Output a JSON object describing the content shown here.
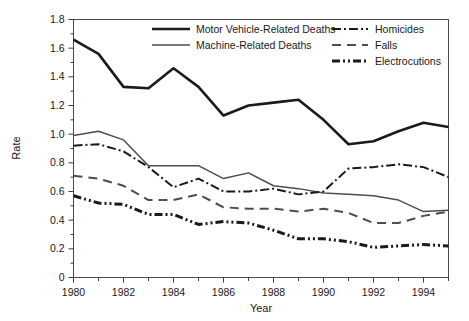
{
  "chart_data": {
    "type": "line",
    "title": "",
    "xlabel": "Year",
    "ylabel": "Rate",
    "xlim": [
      1980,
      1995
    ],
    "ylim": [
      0,
      1.8
    ],
    "grid": false,
    "legend_position": "top-inside",
    "x": [
      1980,
      1981,
      1982,
      1983,
      1984,
      1985,
      1986,
      1987,
      1988,
      1989,
      1990,
      1991,
      1992,
      1993,
      1994,
      1995
    ],
    "xtick_labels": [
      "1980",
      "1982",
      "1984",
      "1986",
      "1988",
      "1990",
      "1992",
      "1994"
    ],
    "xtick_values": [
      1980,
      1982,
      1984,
      1986,
      1988,
      1990,
      1992,
      1994
    ],
    "xminor_values": [
      1981,
      1983,
      1985,
      1987,
      1989,
      1991,
      1993,
      1995
    ],
    "ytick_labels": [
      "0",
      "0.2",
      "0.4",
      "0.6",
      "0.8",
      "1.0",
      "1.2",
      "1.4",
      "1.6",
      "1.8"
    ],
    "ytick_values": [
      0,
      0.2,
      0.4,
      0.6,
      0.8,
      1.0,
      1.2,
      1.4,
      1.6,
      1.8
    ],
    "series": [
      {
        "name": "Motor Vehicle-Related Deaths",
        "style": "solid-thick",
        "color": "#1a1a1a",
        "width": 2.6,
        "dash": "",
        "values": [
          1.66,
          1.56,
          1.33,
          1.32,
          1.46,
          1.33,
          1.13,
          1.2,
          1.22,
          1.24,
          1.1,
          0.93,
          0.95,
          1.02,
          1.08,
          1.05
        ]
      },
      {
        "name": "Machine-Related Deaths",
        "style": "solid-thin",
        "color": "#4d4d4d",
        "width": 1.5,
        "dash": "",
        "values": [
          0.99,
          1.02,
          0.96,
          0.78,
          0.78,
          0.78,
          0.69,
          0.73,
          0.64,
          0.62,
          0.59,
          0.58,
          0.57,
          0.54,
          0.46,
          0.47
        ]
      },
      {
        "name": "Homicides",
        "style": "dash-dot",
        "color": "#1a1a1a",
        "width": 2.0,
        "dash": "9,3,2,3",
        "values": [
          0.92,
          0.93,
          0.88,
          0.77,
          0.63,
          0.69,
          0.6,
          0.6,
          0.62,
          0.58,
          0.6,
          0.76,
          0.77,
          0.79,
          0.77,
          0.7
        ]
      },
      {
        "name": "Falls",
        "style": "dashed",
        "color": "#4d4d4d",
        "width": 2.0,
        "dash": "9,6",
        "values": [
          0.71,
          0.69,
          0.64,
          0.54,
          0.54,
          0.58,
          0.49,
          0.48,
          0.48,
          0.46,
          0.48,
          0.45,
          0.38,
          0.38,
          0.43,
          0.46
        ]
      },
      {
        "name": "Electrocutions",
        "style": "dash-dot-dot",
        "color": "#1a1a1a",
        "width": 3.0,
        "dash": "8,3,2,3,2,3",
        "values": [
          0.57,
          0.52,
          0.51,
          0.44,
          0.44,
          0.37,
          0.39,
          0.38,
          0.33,
          0.27,
          0.27,
          0.25,
          0.21,
          0.22,
          0.23,
          0.22
        ]
      }
    ]
  },
  "legend": {
    "entries": [
      {
        "label": "Motor Vehicle-Related Deaths"
      },
      {
        "label": "Machine-Related Deaths"
      },
      {
        "label": "Homicides"
      },
      {
        "label": "Falls"
      },
      {
        "label": "Electrocutions"
      }
    ]
  },
  "axes": {
    "y_title": "Rate",
    "x_title": "Year"
  }
}
